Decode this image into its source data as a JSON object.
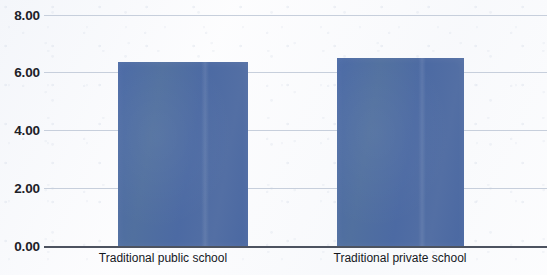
{
  "chart_data": {
    "type": "bar",
    "title": "",
    "xlabel": "",
    "ylabel": "",
    "categories": [
      "Traditional public school",
      "Traditional private school"
    ],
    "values": [
      6.41,
      6.55
    ],
    "series": [
      {
        "name": "",
        "values": [
          6.41,
          6.55
        ]
      }
    ],
    "ylim": [
      0.0,
      8.0
    ],
    "ytick_labels": [
      "0.00",
      "2.00",
      "4.00",
      "6.00",
      "8.00"
    ],
    "ytick_values": [
      0.0,
      2.0,
      4.0,
      6.0,
      8.0
    ],
    "grid": true,
    "legend": false,
    "legend_position": "none",
    "bar_color": "#4d6ca4",
    "gridline_color": "#c7cfdc",
    "axis_color": "#4d5360",
    "background_color": "#fdfdfe",
    "text_color": "#1d2128"
  },
  "axis": {
    "y": {
      "ticks": [
        {
          "label": "8.00",
          "value": 8.0
        },
        {
          "label": "6.00",
          "value": 6.0
        },
        {
          "label": "4.00",
          "value": 4.0
        },
        {
          "label": "2.00",
          "value": 2.0
        },
        {
          "label": "0.00",
          "value": 0.0
        }
      ]
    },
    "x": {
      "ticks": [
        {
          "label": "Traditional public school"
        },
        {
          "label": "Traditional private school"
        }
      ]
    }
  }
}
